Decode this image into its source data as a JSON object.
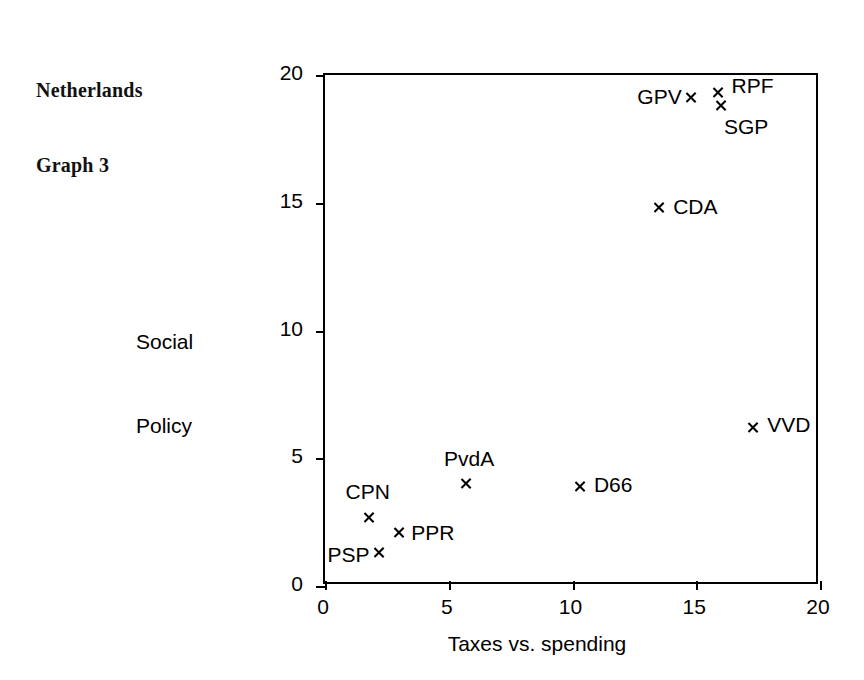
{
  "title": {
    "line1": "Netherlands",
    "line2": "Graph 3"
  },
  "axis": {
    "xlabel": "Taxes vs. spending",
    "ylabel_line1": "Social",
    "ylabel_line2": "Policy"
  },
  "xticks": [
    "0",
    "5",
    "10",
    "15",
    "20"
  ],
  "yticks": [
    "0",
    "5",
    "10",
    "15",
    "20"
  ],
  "points": [
    {
      "label": "GPV",
      "x": 14.8,
      "y": 19.1
    },
    {
      "label": "RPF",
      "x": 15.9,
      "y": 19.3
    },
    {
      "label": "SGP",
      "x": 16.0,
      "y": 18.8
    },
    {
      "label": "CDA",
      "x": 13.5,
      "y": 14.8
    },
    {
      "label": "VVD",
      "x": 17.3,
      "y": 6.2
    },
    {
      "label": "PvdA",
      "x": 5.7,
      "y": 4.0
    },
    {
      "label": "D66",
      "x": 10.3,
      "y": 3.9
    },
    {
      "label": "CPN",
      "x": 1.8,
      "y": 2.7
    },
    {
      "label": "PPR",
      "x": 3.0,
      "y": 2.1
    },
    {
      "label": "PSP",
      "x": 2.2,
      "y": 1.3
    }
  ],
  "chart_data": {
    "type": "scatter",
    "title": "Netherlands Graph 3",
    "xlabel": "Taxes vs. spending",
    "ylabel": "Social Policy",
    "xlim": [
      0,
      20
    ],
    "ylim": [
      0,
      20
    ],
    "xticks": [
      0,
      5,
      10,
      15,
      20
    ],
    "yticks": [
      0,
      5,
      10,
      15,
      20
    ],
    "grid": false,
    "legend": "none",
    "marker": "x",
    "marker_color": "#000000",
    "point_labels": [
      "GPV",
      "RPF",
      "SGP",
      "CDA",
      "VVD",
      "PvdA",
      "D66",
      "CPN",
      "PPR",
      "PSP"
    ],
    "x": [
      14.8,
      15.9,
      16.0,
      13.5,
      17.3,
      5.7,
      10.3,
      1.8,
      3.0,
      2.2
    ],
    "y": [
      19.1,
      19.3,
      18.8,
      14.8,
      6.2,
      4.0,
      3.9,
      2.7,
      2.1,
      1.3
    ],
    "points": [
      {
        "name": "GPV",
        "x": 14.8,
        "y": 19.1
      },
      {
        "name": "RPF",
        "x": 15.9,
        "y": 19.3
      },
      {
        "name": "SGP",
        "x": 16.0,
        "y": 18.8
      },
      {
        "name": "CDA",
        "x": 13.5,
        "y": 14.8
      },
      {
        "name": "VVD",
        "x": 17.3,
        "y": 6.2
      },
      {
        "name": "PvdA",
        "x": 5.7,
        "y": 4.0
      },
      {
        "name": "D66",
        "x": 10.3,
        "y": 3.9
      },
      {
        "name": "CPN",
        "x": 1.8,
        "y": 2.7
      },
      {
        "name": "PPR",
        "x": 3.0,
        "y": 2.1
      },
      {
        "name": "PSP",
        "x": 2.2,
        "y": 1.3
      }
    ]
  },
  "label_offsets": {
    "GPV": {
      "dx": -54,
      "dy": 0,
      "anchor": "left"
    },
    "RPF": {
      "dx": 13,
      "dy": -6,
      "anchor": "left"
    },
    "SGP": {
      "dx": 3,
      "dy": 22,
      "anchor": "left"
    },
    "CDA": {
      "dx": 14,
      "dy": 0,
      "anchor": "left"
    },
    "VVD": {
      "dx": 14,
      "dy": -2,
      "anchor": "left"
    },
    "PvdA": {
      "dx": -22,
      "dy": -24,
      "anchor": "left"
    },
    "D66": {
      "dx": 14,
      "dy": 0,
      "anchor": "left"
    },
    "CPN": {
      "dx": -24,
      "dy": -24,
      "anchor": "left"
    },
    "PPR": {
      "dx": 12,
      "dy": 2,
      "anchor": "left"
    },
    "PSP": {
      "dx": -52,
      "dy": 3,
      "anchor": "left"
    }
  }
}
